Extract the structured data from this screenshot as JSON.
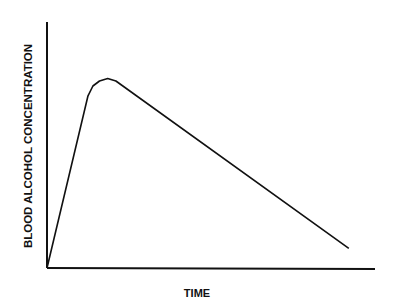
{
  "chart_data": {
    "type": "line",
    "title": "",
    "xlabel": "TIME",
    "ylabel": "BLOOD ALCOHOL CONCENTRATION",
    "grid": false,
    "legend": null,
    "x_ticks": [],
    "y_ticks": [],
    "xlim": [
      0,
      100
    ],
    "ylim": [
      0,
      100
    ],
    "series": [
      {
        "name": "Blood alcohol concentration",
        "x": [
          0,
          12.5,
          14,
          16,
          18.5,
          21,
          92
        ],
        "y": [
          0,
          70,
          74,
          76,
          77,
          76,
          8
        ]
      }
    ],
    "annotations": []
  },
  "colors": {
    "line": "#111111",
    "axis": "#111111",
    "background": "#ffffff"
  }
}
